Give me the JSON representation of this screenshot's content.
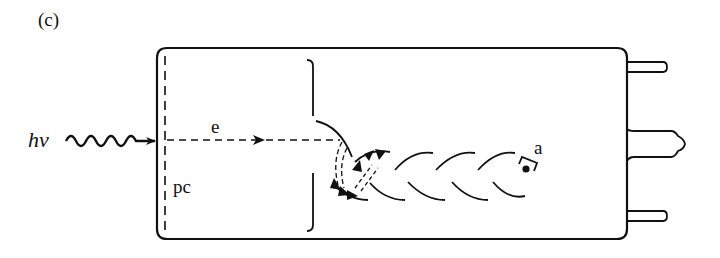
{
  "figure": {
    "panel_label": "(c)",
    "labels": {
      "photon": "hν",
      "electron": "e",
      "photocathode": "pc",
      "anode": "a"
    },
    "components": [
      {
        "name": "incident-photon",
        "label": "hν",
        "shape": "wavy arrow"
      },
      {
        "name": "photocathode",
        "label": "pc",
        "shape": "dashed vertical line"
      },
      {
        "name": "electron-path",
        "label": "e",
        "shape": "dashed arrow"
      },
      {
        "name": "focusing-electrode",
        "label": "",
        "shape": "bracket"
      },
      {
        "name": "dynode-chain",
        "label": "",
        "shape": "interleaved curved dynodes with secondary-electron cascade"
      },
      {
        "name": "anode",
        "label": "a",
        "shape": "cup with dot"
      },
      {
        "name": "tube-envelope",
        "label": "",
        "shape": "rounded rectangle"
      },
      {
        "name": "base-pins",
        "label": "",
        "shape": "three pins on right, center pin with bulb tip"
      }
    ],
    "colors": {
      "line": "#111111",
      "background": "#ffffff"
    }
  }
}
